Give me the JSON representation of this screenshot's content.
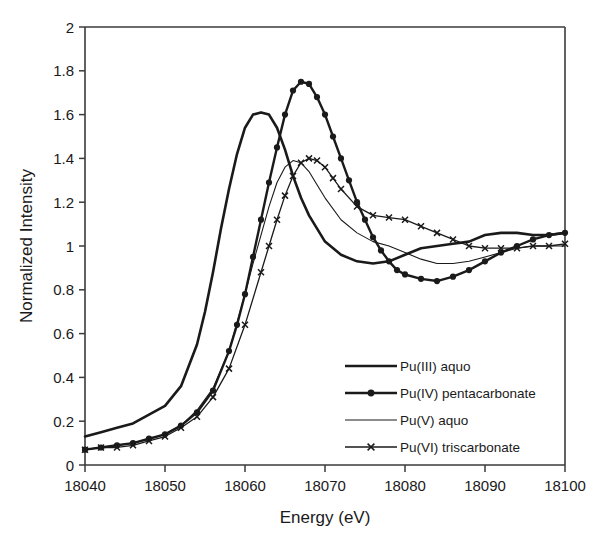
{
  "chart_data": {
    "type": "line",
    "title": "",
    "xlabel": "Energy (eV)",
    "ylabel": "Normalized Intensity",
    "xlim": [
      18040,
      18100
    ],
    "ylim": [
      0,
      2
    ],
    "xticks": [
      18040,
      18050,
      18060,
      18070,
      18080,
      18090,
      18100
    ],
    "yticks": [
      0,
      0.2,
      0.4,
      0.6,
      0.8,
      1,
      1.2,
      1.4,
      1.6,
      1.8,
      2
    ],
    "xtick_labels": [
      "18040",
      "18050",
      "18060",
      "18070",
      "18080",
      "18090",
      "18100"
    ],
    "ytick_labels": [
      "0",
      "0.2",
      "0.4",
      "0.6",
      "0.8",
      "1",
      "1.2",
      "1.4",
      "1.6",
      "1.8",
      "2"
    ],
    "grid": false,
    "legend_position": "inside lower-right",
    "series": [
      {
        "name": "Pu(III) aquo",
        "marker": "none",
        "line_width": 2.6,
        "color": "#1a1a1a",
        "x": [
          18040,
          18042,
          18044,
          18046,
          18048,
          18050,
          18052,
          18054,
          18055,
          18056,
          18057,
          18058,
          18059,
          18060,
          18061,
          18062,
          18063,
          18064,
          18065,
          18066,
          18067,
          18068,
          18070,
          18072,
          18074,
          18076,
          18078,
          18080,
          18082,
          18084,
          18086,
          18088,
          18090,
          18092,
          18094,
          18096,
          18098,
          18100
        ],
        "y": [
          0.13,
          0.15,
          0.17,
          0.19,
          0.23,
          0.27,
          0.36,
          0.55,
          0.7,
          0.88,
          1.08,
          1.26,
          1.42,
          1.54,
          1.6,
          1.61,
          1.6,
          1.54,
          1.44,
          1.32,
          1.22,
          1.14,
          1.02,
          0.96,
          0.93,
          0.92,
          0.93,
          0.96,
          0.99,
          1.0,
          1.01,
          1.02,
          1.05,
          1.06,
          1.06,
          1.05,
          1.05,
          1.06
        ]
      },
      {
        "name": "Pu(IV) pentacarbonate",
        "marker": "circle",
        "line_width": 2.4,
        "color": "#1a1a1a",
        "x": [
          18040,
          18042,
          18044,
          18046,
          18048,
          18050,
          18052,
          18054,
          18056,
          18058,
          18059,
          18060,
          18061,
          18062,
          18063,
          18064,
          18065,
          18066,
          18067,
          18068,
          18069,
          18070,
          18071,
          18072,
          18073,
          18074,
          18075,
          18076,
          18077,
          18078,
          18079,
          18080,
          18082,
          18084,
          18086,
          18088,
          18090,
          18092,
          18094,
          18096,
          18098,
          18100
        ],
        "y": [
          0.07,
          0.08,
          0.09,
          0.1,
          0.12,
          0.14,
          0.18,
          0.24,
          0.34,
          0.52,
          0.64,
          0.78,
          0.95,
          1.12,
          1.29,
          1.45,
          1.6,
          1.71,
          1.75,
          1.74,
          1.68,
          1.6,
          1.5,
          1.4,
          1.3,
          1.2,
          1.12,
          1.04,
          0.98,
          0.93,
          0.89,
          0.87,
          0.85,
          0.84,
          0.86,
          0.89,
          0.93,
          0.97,
          1.0,
          1.03,
          1.05,
          1.06
        ]
      },
      {
        "name": "Pu(V) aquo",
        "marker": "none",
        "line_width": 1.1,
        "color": "#1a1a1a",
        "x": [
          18040,
          18042,
          18044,
          18046,
          18048,
          18050,
          18052,
          18054,
          18056,
          18058,
          18060,
          18061,
          18062,
          18063,
          18064,
          18065,
          18066,
          18067,
          18068,
          18069,
          18070,
          18072,
          18074,
          18076,
          18078,
          18080,
          18082,
          18084,
          18086,
          18088,
          18090,
          18092,
          18094,
          18096,
          18098,
          18100
        ],
        "y": [
          0.07,
          0.08,
          0.09,
          0.1,
          0.12,
          0.14,
          0.18,
          0.25,
          0.35,
          0.52,
          0.78,
          0.92,
          1.05,
          1.18,
          1.29,
          1.36,
          1.39,
          1.38,
          1.34,
          1.28,
          1.22,
          1.12,
          1.06,
          1.02,
          1.0,
          0.97,
          0.94,
          0.92,
          0.92,
          0.93,
          0.95,
          0.97,
          0.99,
          1.0,
          1.0,
          1.0
        ]
      },
      {
        "name": "Pu(VI) triscarbonate",
        "marker": "x",
        "line_width": 1.3,
        "color": "#1a1a1a",
        "x": [
          18040,
          18042,
          18044,
          18046,
          18048,
          18050,
          18052,
          18054,
          18056,
          18058,
          18060,
          18062,
          18063,
          18064,
          18065,
          18066,
          18067,
          18068,
          18069,
          18070,
          18071,
          18072,
          18074,
          18076,
          18078,
          18080,
          18082,
          18084,
          18086,
          18088,
          18090,
          18092,
          18094,
          18096,
          18098,
          18100
        ],
        "y": [
          0.07,
          0.08,
          0.08,
          0.09,
          0.11,
          0.13,
          0.17,
          0.22,
          0.31,
          0.44,
          0.64,
          0.88,
          1.0,
          1.12,
          1.23,
          1.32,
          1.38,
          1.4,
          1.39,
          1.36,
          1.31,
          1.26,
          1.18,
          1.14,
          1.13,
          1.12,
          1.09,
          1.06,
          1.03,
          1.0,
          0.99,
          0.99,
          0.99,
          1.0,
          1.0,
          1.01
        ]
      }
    ]
  },
  "legend": {
    "entries": [
      {
        "label": "Pu(III) aquo",
        "marker": "none",
        "width": 2.6
      },
      {
        "label": "Pu(IV) pentacarbonate",
        "marker": "circle",
        "width": 2.4
      },
      {
        "label": "Pu(V) aquo",
        "marker": "none",
        "width": 1.1
      },
      {
        "label": "Pu(VI) triscarbonate",
        "marker": "x",
        "width": 1.3
      }
    ]
  }
}
